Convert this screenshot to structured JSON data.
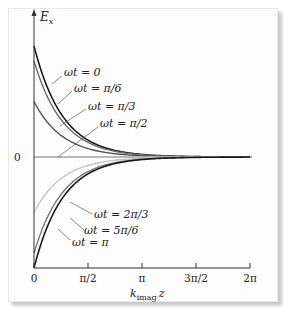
{
  "chart_data": {
    "type": "line",
    "title": "",
    "xlabel": "k_imag z",
    "ylabel": "E_x",
    "xlim": [
      0,
      6.2832
    ],
    "ylim": [
      -1,
      1
    ],
    "grid": false,
    "x_ticks": [
      "0",
      "π/2",
      "π",
      "3π/2",
      "2π"
    ],
    "y_ticks": [
      "0"
    ],
    "function": "E_x = exp(-k_imag z) * cos(ωt - ... ) envelope-damped; curves start at cos(ωt)",
    "series": [
      {
        "name": "ωt = 0",
        "start_value": 1.0,
        "color": "#1a1a1a"
      },
      {
        "name": "ωt = π/6",
        "start_value": 0.866,
        "color": "#6a6a6a"
      },
      {
        "name": "ωt = π/3",
        "start_value": 0.5,
        "color": "#555555"
      },
      {
        "name": "ωt = π/2",
        "start_value": 0.0,
        "color": "#bbbbbb"
      },
      {
        "name": "ωt = 2π/3",
        "start_value": -0.5,
        "color": "#c4c4c4"
      },
      {
        "name": "ωt = 5π/6",
        "start_value": -0.866,
        "color": "#777777"
      },
      {
        "name": "ωt = π",
        "start_value": -1.0,
        "color": "#1a1a1a"
      }
    ],
    "legend_position": "inline annotations"
  },
  "labels": {
    "ylabel": "E",
    "ylabel_sub": "x",
    "xlabel": "k",
    "xlabel_sub": "imag",
    "xlabel_z": "z",
    "zero": "0",
    "ticks": [
      "0",
      "π/2",
      "π",
      "3π/2",
      "2π"
    ],
    "curves": [
      "ωt = 0",
      "ωt = π/6",
      "ωt = π/3",
      "ωt = π/2",
      "ωt = 2π/3",
      "ωt = 5π/6",
      "ωt = π"
    ]
  }
}
